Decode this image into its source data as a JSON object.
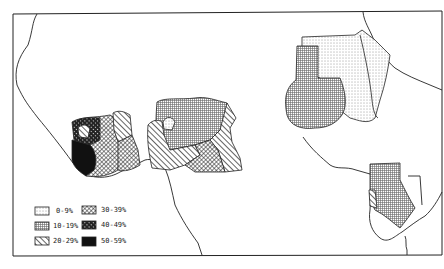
{
  "map": {
    "type": "choropleth",
    "style": "black-and-white hatched",
    "regions": {
      "west_africa_left": [
        "40-49%",
        "50-59%",
        "30-39%",
        "20-29%"
      ],
      "west_africa_right": [
        "10-19%",
        "0-9%",
        "20-29%",
        "30-39%"
      ],
      "east_africa_north": [
        "0-9%",
        "10-19%"
      ],
      "east_africa_south": [
        "10-19%",
        "20-29%"
      ]
    }
  },
  "legend": {
    "items": [
      {
        "label": "0-9%",
        "pattern": "dots"
      },
      {
        "label": "10-19%",
        "pattern": "fine-grid"
      },
      {
        "label": "20-29%",
        "pattern": "diagonal-hatch"
      },
      {
        "label": "30-39%",
        "pattern": "crosshatch"
      },
      {
        "label": "40-49%",
        "pattern": "dense-crosshatch"
      },
      {
        "label": "50-59%",
        "pattern": "solid-black"
      }
    ]
  },
  "colors": {
    "ink": "#222222",
    "paper": "#ffffff"
  }
}
